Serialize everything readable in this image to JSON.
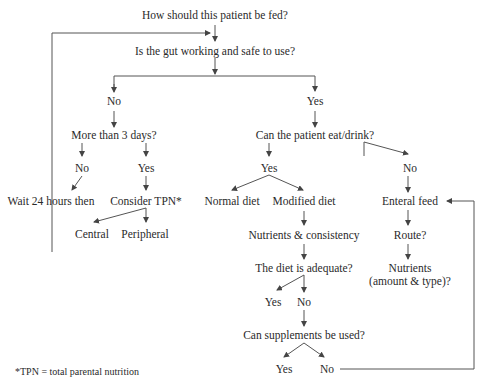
{
  "diagram": {
    "nodes": {
      "q_fed": "How should this patient be fed?",
      "q_gut": "Is the gut working and safe to use?",
      "gut_no": "No",
      "gut_yes": "Yes",
      "q_3days": "More than 3 days?",
      "d_no": "No",
      "d_yes": "Yes",
      "wait": "Wait 24 hours then",
      "tpn": "Consider TPN*",
      "central": "Central",
      "peripheral": "Peripheral",
      "q_eat": "Can the patient eat/drink?",
      "eat_yes": "Yes",
      "eat_no": "No",
      "normal": "Normal diet",
      "modified": "Modified diet",
      "nutrients_consistency": "Nutrients & consistency",
      "q_adequate": "The diet is adequate?",
      "adq_yes": "Yes",
      "adq_no": "No",
      "q_supp": "Can supplements be used?",
      "supp_yes": "Yes",
      "supp_no": "No",
      "enteral": "Enteral feed",
      "route": "Route?",
      "nutrients_1": "Nutrients",
      "nutrients_2": "(amount & type)?"
    },
    "footnote": "*TPN = total parental nutrition"
  }
}
